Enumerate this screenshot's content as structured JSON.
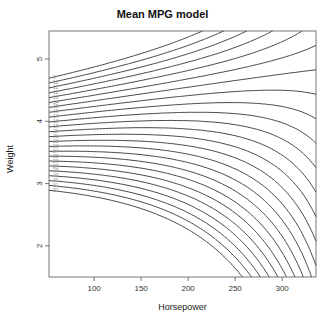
{
  "chart_data": {
    "type": "contour",
    "title": "Mean MPG model",
    "xlabel": "Horsepower",
    "ylabel": "Weight",
    "xlim": [
      52,
      336
    ],
    "ylim": [
      1.5,
      5.45
    ],
    "x_ticks": [
      100,
      150,
      200,
      250,
      300
    ],
    "y_ticks": [
      2,
      3,
      4,
      5
    ],
    "contour_levels": [
      9,
      10,
      11,
      12,
      13,
      14,
      15,
      16,
      17,
      18,
      19,
      20,
      21,
      22,
      23,
      24,
      25,
      26,
      27,
      28,
      29,
      30,
      31,
      32
    ],
    "line_style": "dashed",
    "saddle_point": {
      "horsepower": 290,
      "weight": 4.5
    }
  }
}
